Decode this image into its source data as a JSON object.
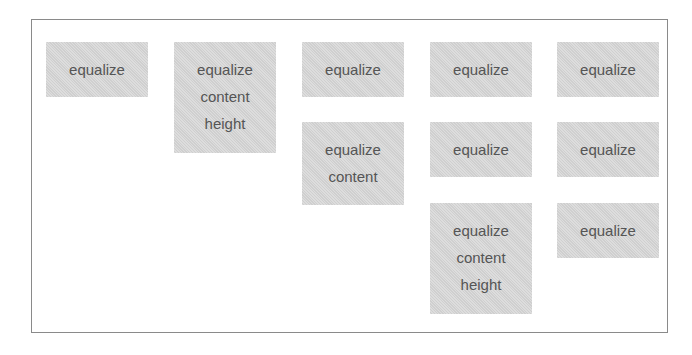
{
  "boxes": [
    {
      "lines": [
        "equalize"
      ],
      "x": 46,
      "y": 42,
      "h": 55
    },
    {
      "lines": [
        "equalize",
        "content",
        "height"
      ],
      "x": 174,
      "y": 42,
      "h": 111
    },
    {
      "lines": [
        "equalize"
      ],
      "x": 302,
      "y": 42,
      "h": 55
    },
    {
      "lines": [
        "equalize",
        "content"
      ],
      "x": 302,
      "y": 122,
      "h": 83
    },
    {
      "lines": [
        "equalize"
      ],
      "x": 430,
      "y": 42,
      "h": 55
    },
    {
      "lines": [
        "equalize"
      ],
      "x": 430,
      "y": 122,
      "h": 55
    },
    {
      "lines": [
        "equalize",
        "content",
        "height"
      ],
      "x": 430,
      "y": 203,
      "h": 111
    },
    {
      "lines": [
        "equalize"
      ],
      "x": 557,
      "y": 42,
      "h": 55
    },
    {
      "lines": [
        "equalize"
      ],
      "x": 557,
      "y": 122,
      "h": 55
    },
    {
      "lines": [
        "equalize"
      ],
      "x": 557,
      "y": 203,
      "h": 55
    }
  ]
}
